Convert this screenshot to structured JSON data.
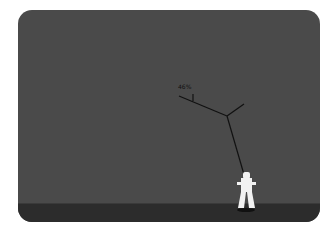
{
  "game": {
    "percent_label": "46%",
    "colors": {
      "panel": "#4a4a4a",
      "ground": "#2c2c2c",
      "rope": "#111111",
      "figure": "#f2f2f2"
    }
  }
}
